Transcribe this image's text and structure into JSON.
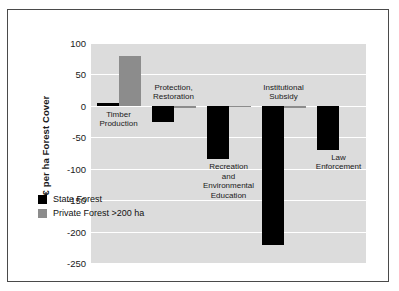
{
  "chart_data": {
    "type": "bar",
    "title": "",
    "xlabel": "",
    "ylabel": "€ per ha Forest Cover",
    "ylim": [
      -250,
      100
    ],
    "ytick_step": 50,
    "yticks": [
      100,
      50,
      0,
      -50,
      -100,
      -150,
      -200,
      -250
    ],
    "ytick_labels": [
      "100",
      "50",
      "0",
      "-50",
      "-100",
      "-150",
      "-200",
      "-250"
    ],
    "grid": true,
    "grid_axis": "y",
    "legend_position": "inside-lower-left",
    "categories": [
      "Timber\nProduction",
      "Protection,\nRestoration",
      "Recreation\nand\nEnvironmental\nEducation",
      "Institutional\nSubsidy",
      "Law\nEnforcement"
    ],
    "series": [
      {
        "name": "State Forest",
        "color": "#000000",
        "values": [
          5,
          -25,
          -85,
          -221,
          -70
        ]
      },
      {
        "name": "Private Forest >200 ha",
        "color": "#8c8c8c",
        "values": [
          80,
          -3,
          -2,
          -3,
          0
        ]
      }
    ]
  },
  "axis": {
    "y_title": "€ per ha Forest Cover",
    "ticks": [
      {
        "label": "100",
        "value": 100
      },
      {
        "label": "50",
        "value": 50
      },
      {
        "label": "0",
        "value": 0
      },
      {
        "label": "-50",
        "value": -50
      },
      {
        "label": "-100",
        "value": -100
      },
      {
        "label": "-150",
        "value": -150
      },
      {
        "label": "-200",
        "value": -200
      },
      {
        "label": "-250",
        "value": -250
      }
    ]
  },
  "groups": [
    {
      "label": "Timber\nProduction",
      "label_position": "below-zero"
    },
    {
      "label": "Protection,\nRestoration",
      "label_position": "above-zero"
    },
    {
      "label": "Recreation\nand\nEnvironmental\nEducation",
      "label_position": "below-bar"
    },
    {
      "label": "Institutional\nSubsidy",
      "label_position": "above-zero"
    },
    {
      "label": "Law\nEnforcement",
      "label_position": "below-bar"
    }
  ],
  "legend": {
    "items": [
      {
        "label": "State Forest",
        "color": "#000000"
      },
      {
        "label": "Private Forest >200 ha",
        "color": "#8c8c8c"
      }
    ]
  },
  "colors": {
    "plot_background": "#dcdcdc",
    "gridline": "#ffffff",
    "frame": "#4a4a4a",
    "state_forest": "#000000",
    "private_forest": "#8c8c8c",
    "page_background": "#ffffff"
  }
}
